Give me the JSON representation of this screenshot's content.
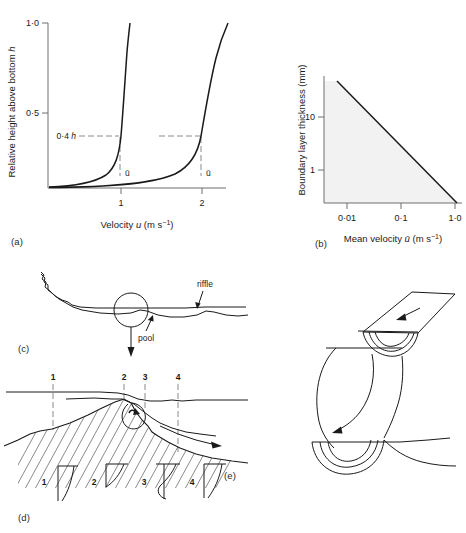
{
  "figure": {
    "panels": [
      {
        "id": "a",
        "label": "(a)"
      },
      {
        "id": "b",
        "label": "(b)"
      },
      {
        "id": "c",
        "label": "(c)"
      },
      {
        "id": "d",
        "label": "(d)"
      },
      {
        "id": "e",
        "label": "(e)"
      }
    ]
  },
  "panel_a": {
    "ylabel": "Relative height above bottom",
    "ylabel_symbol": "h",
    "xlabel_prefix": "Velocity",
    "xlabel_symbol": "u",
    "xlabel_units": "(m s",
    "xlabel_exp": "−1",
    "xlabel_close": ")",
    "y_ticks": [
      "1·0",
      "0·5"
    ],
    "x_ticks": [
      "1",
      "2"
    ],
    "annotation": "0·4",
    "annotation_symbol": "h",
    "mean_symbol": "ū",
    "mean_markers": [
      "ū",
      "ū"
    ]
  },
  "panel_b": {
    "ylabel": "Boundary layer thickness (mm)",
    "xlabel_prefix": "Mean velocity",
    "xlabel_symbol": "ū",
    "xlabel_units": "(m s",
    "xlabel_exp": "−1",
    "xlabel_close": ")",
    "y_ticks": [
      "10",
      "1"
    ],
    "x_ticks": [
      "0·01",
      "0·1",
      "1·0"
    ],
    "shade_color": "#f2f2f2"
  },
  "panel_c": {
    "labels": {
      "riffle": "riffle",
      "pool": "pool"
    }
  },
  "panel_d": {
    "station_numbers": [
      "1",
      "2",
      "3",
      "4"
    ],
    "profile_numbers": [
      "1",
      "2",
      "3",
      "4"
    ]
  },
  "panel_e": {}
}
